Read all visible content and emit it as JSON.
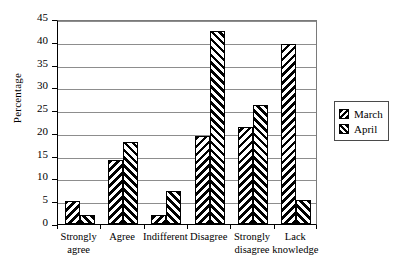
{
  "chart_data": {
    "type": "bar",
    "title": "",
    "xlabel": "",
    "ylabel": "Percentage",
    "ylim": [
      0,
      45
    ],
    "ytick_step": 5,
    "yticks": [
      0,
      5,
      10,
      15,
      20,
      25,
      30,
      35,
      40,
      45
    ],
    "grid": true,
    "legend_position": "right",
    "categories": [
      "Strongly\nagree",
      "Agree",
      "Indifferent",
      "Disagree",
      "Strongly\ndisagree",
      "Lack\nknowledge"
    ],
    "series": [
      {
        "name": "March",
        "values": [
          5.1,
          14.1,
          2.0,
          19.4,
          21.3,
          39.5
        ]
      },
      {
        "name": "April",
        "values": [
          1.9,
          18.1,
          7.2,
          42.4,
          26.2,
          5.3
        ]
      }
    ]
  },
  "legend": {
    "items": [
      {
        "label": "March"
      },
      {
        "label": "April"
      }
    ]
  }
}
